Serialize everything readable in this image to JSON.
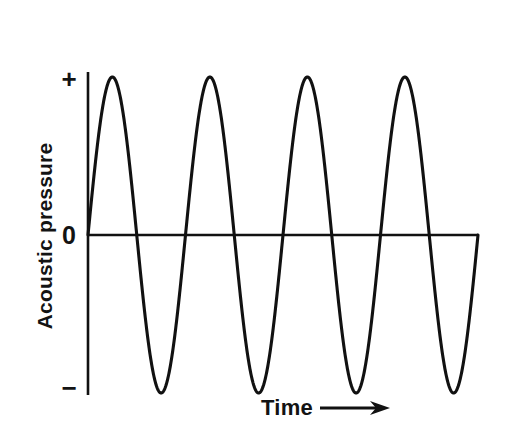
{
  "figure": {
    "background_color": "#ffffff",
    "line_color": "#111111",
    "axis_color": "#111111"
  },
  "axes": {
    "y_title": "Acoustic pressure",
    "x_title": "Time",
    "x_arrow_icon": "arrow-right-icon",
    "y_ticks": [
      {
        "label": "+",
        "name": "y-tick-positive"
      },
      {
        "label": "0",
        "name": "y-tick-zero"
      },
      {
        "label": "−",
        "name": "y-tick-negative"
      }
    ]
  },
  "chart_data": {
    "type": "line",
    "title": "",
    "subtitle": "",
    "xlabel": "Time",
    "ylabel": "Acoustic pressure",
    "waveform": "sine",
    "grid": false,
    "legend": null,
    "xlim": [
      0,
      4.0
    ],
    "ylim": [
      -1.12,
      1.12
    ],
    "x_tick_labels": [],
    "y_tick_labels": [
      "+",
      "0",
      "−"
    ],
    "y_tick_values": [
      1.0,
      0.0,
      -1.0
    ],
    "amplitude": 1.0,
    "cycles": 4.0,
    "period_px": 98,
    "phase": 0,
    "peaks": {
      "x": [
        0.25,
        1.25,
        2.25,
        3.25
      ],
      "y": [
        1.0,
        1.0,
        1.0,
        1.0
      ],
      "x_px": [
        113,
        211,
        309,
        406
      ],
      "y_px": [
        77,
        77,
        77,
        77
      ]
    },
    "troughs": {
      "x": [
        0.75,
        1.75,
        2.75,
        3.75
      ],
      "y": [
        -1.0,
        -1.0,
        -1.0,
        -1.0
      ],
      "x_px": [
        163,
        261,
        358,
        455
      ],
      "y_px": [
        393,
        393,
        393,
        393
      ]
    },
    "zero_crossings": {
      "x": [
        0.0,
        0.5,
        1.0,
        1.5,
        2.0,
        2.5,
        3.0,
        3.5,
        4.0
      ],
      "x_px": [
        88,
        137,
        186,
        235,
        284,
        333,
        382,
        431,
        478
      ]
    },
    "series": [
      {
        "name": "acoustic pressure",
        "x": [
          0.0,
          0.125,
          0.25,
          0.375,
          0.5,
          0.625,
          0.75,
          0.875,
          1.0,
          1.125,
          1.25,
          1.375,
          1.5,
          1.625,
          1.75,
          1.875,
          2.0,
          2.125,
          2.25,
          2.375,
          2.5,
          2.625,
          2.75,
          2.875,
          3.0,
          3.125,
          3.25,
          3.375,
          3.5,
          3.625,
          3.75,
          3.875,
          4.0
        ],
        "values": [
          0.0,
          0.707,
          1.0,
          0.707,
          0.0,
          -0.707,
          -1.0,
          -0.707,
          0.0,
          0.707,
          1.0,
          0.707,
          0.0,
          -0.707,
          -1.0,
          -0.707,
          0.0,
          0.707,
          1.0,
          0.707,
          0.0,
          -0.707,
          -1.0,
          -0.707,
          0.0,
          0.707,
          1.0,
          0.707,
          0.0,
          -0.707,
          -1.0,
          -0.707,
          0.0
        ]
      }
    ],
    "axis_geometry_px": {
      "y_axis_x": 88,
      "y_axis_top": 72,
      "y_axis_bottom": 395,
      "zero_line_y": 235,
      "zero_line_left": 88,
      "zero_line_right": 478
    }
  }
}
